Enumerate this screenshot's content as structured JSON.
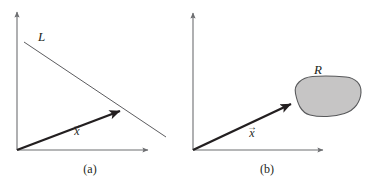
{
  "figure": {
    "width": 365,
    "height": 187,
    "background": "#ffffff",
    "ink_color": "#231f20",
    "axis_color": "#6d6e71",
    "blob_fill": "#c6c5c5",
    "blob_stroke": "#58595b"
  },
  "panels": [
    {
      "id": "a",
      "caption": "(a)",
      "labels": {
        "line": "L",
        "vector_symbol": "x",
        "vector_arrow": "→"
      },
      "geometry": {
        "origin": [
          17,
          150
        ],
        "y_axis_top": [
          17,
          10
        ],
        "x_axis_right": [
          150,
          150
        ],
        "line_start": [
          24,
          42
        ],
        "line_end": [
          166,
          137
        ],
        "vector_tip": [
          127,
          107
        ]
      }
    },
    {
      "id": "b",
      "caption": "(b)",
      "labels": {
        "region": "R",
        "vector_symbol": "x",
        "vector_arrow": "→"
      },
      "geometry": {
        "origin": [
          10,
          150
        ],
        "y_axis_top": [
          10,
          11
        ],
        "x_axis_right": [
          142,
          150
        ],
        "vector_tip": [
          115,
          100
        ],
        "blob_center": [
          136,
          96
        ]
      }
    }
  ]
}
